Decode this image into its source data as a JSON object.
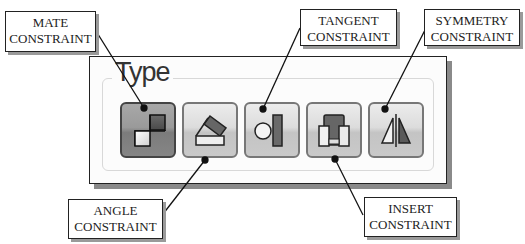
{
  "panel": {
    "group_title": "Type",
    "buttons": [
      {
        "name": "mate",
        "icon": "mate-constraint-icon",
        "active": true
      },
      {
        "name": "angle",
        "icon": "angle-constraint-icon",
        "active": false
      },
      {
        "name": "tangent",
        "icon": "tangent-constraint-icon",
        "active": false
      },
      {
        "name": "insert",
        "icon": "insert-constraint-icon",
        "active": false
      },
      {
        "name": "symmetry",
        "icon": "symmetry-constraint-icon",
        "active": false
      }
    ]
  },
  "callouts": {
    "mate": {
      "line1": "MATE",
      "line2": "CONSTRAINT"
    },
    "tangent": {
      "line1": "TANGENT",
      "line2": "CONSTRAINT"
    },
    "symmetry": {
      "line1": "SYMMETRY",
      "line2": "CONSTRAINT"
    },
    "angle": {
      "line1": "ANGLE",
      "line2": "CONSTRAINT"
    },
    "insert": {
      "line1": "INSERT",
      "line2": "CONSTRAINT"
    }
  },
  "colors": {
    "active_button": "#8c8c8c",
    "button": "#d8d8d8",
    "shape_dark": "#555555"
  }
}
